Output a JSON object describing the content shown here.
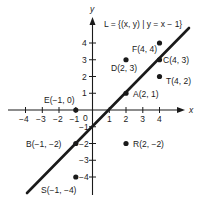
{
  "title": "L = {(x, y) | y = x − 1}",
  "axes": {
    "x_label": "x",
    "y_label": "y",
    "origin_label": "0",
    "x_ticks": [
      "−4",
      "−3",
      "−2",
      "−1",
      "1",
      "2",
      "3",
      "4"
    ],
    "y_ticks": [
      "4",
      "3",
      "2",
      "1",
      "−1",
      "−2",
      "−3",
      "−4"
    ]
  },
  "line": {
    "name": "L",
    "equation": "y = x − 1"
  },
  "points": [
    {
      "name": "F",
      "label": "F(4, 4)",
      "x": 4,
      "y": 4
    },
    {
      "name": "C",
      "label": "C(4, 3)",
      "x": 4,
      "y": 3
    },
    {
      "name": "D",
      "label": "D(2, 3)",
      "x": 2,
      "y": 3
    },
    {
      "name": "T",
      "label": "T(4, 2)",
      "x": 4,
      "y": 2
    },
    {
      "name": "A",
      "label": "A(2, 1)",
      "x": 2,
      "y": 1
    },
    {
      "name": "E",
      "label": "E(−1, 0)",
      "x": -1,
      "y": 0
    },
    {
      "name": "B",
      "label": "B(−1, −2)",
      "x": -1,
      "y": -2
    },
    {
      "name": "R",
      "label": "R(2, −2)",
      "x": 2,
      "y": -2
    },
    {
      "name": "S",
      "label": "S(−1, −4)",
      "x": -1,
      "y": -4
    }
  ],
  "colors": {
    "ink": "#1a1a1a",
    "background": "#ffffff"
  }
}
